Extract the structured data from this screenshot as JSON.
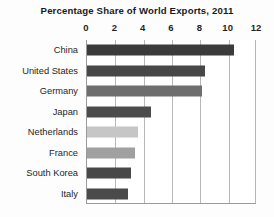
{
  "chart_data": {
    "type": "bar",
    "orientation": "horizontal",
    "title": "Percentage Share of World Exports, 2011",
    "xlabel": "",
    "ylabel": "",
    "xlim": [
      0,
      12
    ],
    "xticks": [
      "0",
      "2",
      "4",
      "6",
      "8",
      "10",
      "12"
    ],
    "xtick_values": [
      0,
      2,
      4,
      6,
      8,
      10,
      12
    ],
    "grid": true,
    "legend": "none",
    "categories": [
      "China",
      "United States",
      "Germany",
      "Japan",
      "Netherlands",
      "France",
      "South Korea",
      "Italy"
    ],
    "values": [
      10.4,
      8.3,
      8.1,
      4.5,
      3.6,
      3.4,
      3.1,
      2.9
    ],
    "bar_colors": [
      "#3b3b3b",
      "#474747",
      "#6e6e6e",
      "#4c4c4c",
      "#c6c6c6",
      "#a0a0a0",
      "#484848",
      "#4a4a4a"
    ],
    "series": [
      {
        "name": "Percentage Share of World Exports",
        "values": [
          10.4,
          8.3,
          8.1,
          4.5,
          3.6,
          3.4,
          3.1,
          2.9
        ]
      }
    ]
  },
  "colors": {
    "axis": "#9a9a9a",
    "gridline": "#b8b8b8",
    "text": "#1f1f1f",
    "background": "#fdfdfd",
    "plot_background": "#ffffff"
  }
}
